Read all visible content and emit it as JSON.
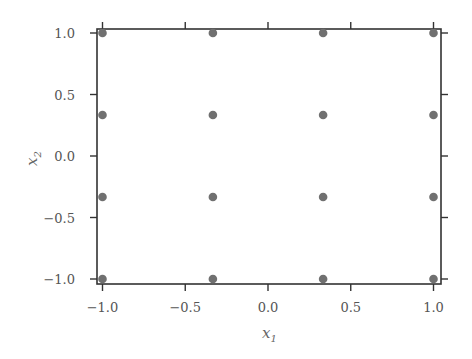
{
  "chart_data": {
    "type": "scatter",
    "title": "",
    "xlabel": "x1",
    "ylabel": "x2",
    "xlabel_parts": {
      "base": "x",
      "sub": "1"
    },
    "ylabel_parts": {
      "base": "x",
      "sub": "2"
    },
    "xlim": [
      -1.02,
      1.02
    ],
    "ylim": [
      -1.04,
      1.04
    ],
    "xticks": [
      -1.0,
      -0.5,
      0.0,
      0.5,
      1.0
    ],
    "yticks": [
      -1.0,
      -0.5,
      0.0,
      0.5,
      1.0
    ],
    "xtick_labels": [
      "−1.0",
      "−0.5",
      "0.0",
      "0.5",
      "1.0"
    ],
    "ytick_labels": [
      "−1.0",
      "−0.5",
      "0.0",
      "0.5",
      "1.0"
    ],
    "grid": false,
    "legend": null,
    "marker_color": "#707070",
    "series": [
      {
        "name": "grid points",
        "points": [
          [
            -1.0,
            1.0
          ],
          [
            -0.333,
            1.0
          ],
          [
            0.333,
            1.0
          ],
          [
            1.0,
            1.0
          ],
          [
            -1.0,
            0.333
          ],
          [
            -0.333,
            0.333
          ],
          [
            0.333,
            0.333
          ],
          [
            1.0,
            0.333
          ],
          [
            -1.0,
            -0.333
          ],
          [
            -0.333,
            -0.333
          ],
          [
            0.333,
            -0.333
          ],
          [
            1.0,
            -0.333
          ],
          [
            -1.0,
            -1.0
          ],
          [
            -0.333,
            -1.0
          ],
          [
            0.333,
            -1.0
          ],
          [
            1.0,
            -1.0
          ]
        ]
      }
    ]
  }
}
